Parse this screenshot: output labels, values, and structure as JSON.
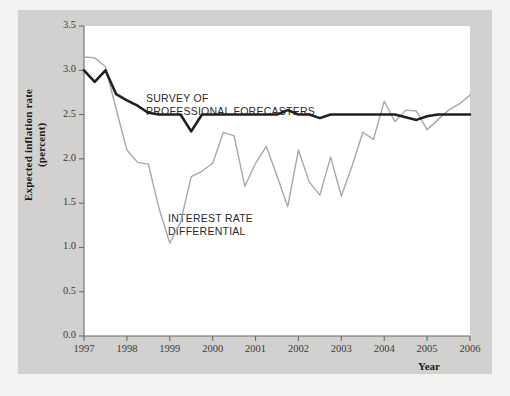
{
  "axes": {
    "y_title_line1": "Expected inflation rate",
    "y_title_line2": "(percent)",
    "x_title": "Year",
    "y_ticks": [
      "3.5",
      "3.0",
      "2.5",
      "2.0",
      "1.5",
      "1.0",
      "0.5",
      "0.0"
    ],
    "x_ticks": [
      "1997",
      "1998",
      "1999",
      "2000",
      "2001",
      "2002",
      "2003",
      "2004",
      "2005",
      "2006"
    ]
  },
  "annotations": {
    "spf_line1": "SURVEY OF",
    "spf_line2": "PROFESSIONAL FORECASTERS",
    "ird_line1": "INTEREST RATE",
    "ird_line2": "DIFFERENTIAL"
  },
  "colors": {
    "background": "#f4f3f1",
    "plate": "#d2d1cf",
    "plot_background": "#ffffff",
    "survey_line": "#231f20",
    "differential_line": "#a8a8a8",
    "axis": "#6b6b6b",
    "tick_text": "#3a3a3a"
  },
  "chart_data": {
    "type": "line",
    "title": "",
    "xlabel": "Year",
    "ylabel": "Expected inflation rate (percent)",
    "xlim": [
      1997,
      2006
    ],
    "ylim": [
      0.0,
      3.5
    ],
    "ytick_step": 0.5,
    "grid": false,
    "legend": "inline-annotations",
    "series": [
      {
        "name": "SURVEY OF PROFESSIONAL FORECASTERS",
        "color": "#231f20",
        "width": 2.6,
        "x": [
          1997.0,
          1997.25,
          1997.5,
          1997.75,
          1998.0,
          1998.25,
          1998.5,
          1998.75,
          1999.0,
          1999.25,
          1999.5,
          1999.75,
          2000.0,
          2000.25,
          2000.5,
          2000.75,
          2001.0,
          2001.25,
          2001.5,
          2001.75,
          2002.0,
          2002.25,
          2002.5,
          2002.75,
          2003.0,
          2003.25,
          2003.5,
          2003.75,
          2004.0,
          2004.25,
          2004.5,
          2004.75,
          2005.0,
          2005.25,
          2005.5,
          2005.75,
          2006.0
        ],
        "y": [
          3.0,
          2.87,
          3.0,
          2.73,
          2.66,
          2.6,
          2.52,
          2.5,
          2.5,
          2.5,
          2.31,
          2.5,
          2.5,
          2.5,
          2.5,
          2.5,
          2.5,
          2.5,
          2.5,
          2.55,
          2.5,
          2.5,
          2.46,
          2.5,
          2.5,
          2.5,
          2.5,
          2.5,
          2.5,
          2.5,
          2.47,
          2.44,
          2.48,
          2.5,
          2.5,
          2.5,
          2.5
        ]
      },
      {
        "name": "INTEREST RATE DIFFERENTIAL",
        "color": "#a8a8a8",
        "width": 1.4,
        "x": [
          1997.0,
          1997.25,
          1997.5,
          1997.75,
          1998.0,
          1998.25,
          1998.5,
          1998.75,
          1999.0,
          1999.25,
          1999.5,
          1999.75,
          2000.0,
          2000.25,
          2000.5,
          2000.75,
          2001.0,
          2001.25,
          2001.5,
          2001.75,
          2002.0,
          2002.25,
          2002.5,
          2002.75,
          2003.0,
          2003.25,
          2003.5,
          2003.75,
          2004.0,
          2004.25,
          2004.5,
          2004.75,
          2005.0,
          2005.25,
          2005.5,
          2005.75,
          2006.0
        ],
        "y": [
          3.15,
          3.14,
          3.04,
          2.56,
          2.1,
          1.96,
          1.94,
          1.44,
          1.05,
          1.28,
          1.8,
          1.86,
          1.95,
          2.3,
          2.26,
          1.69,
          1.95,
          2.14,
          1.81,
          1.46,
          2.1,
          1.74,
          1.59,
          2.02,
          1.58,
          1.92,
          2.3,
          2.22,
          2.65,
          2.42,
          2.55,
          2.54,
          2.33,
          2.44,
          2.55,
          2.62,
          2.72
        ]
      }
    ]
  }
}
